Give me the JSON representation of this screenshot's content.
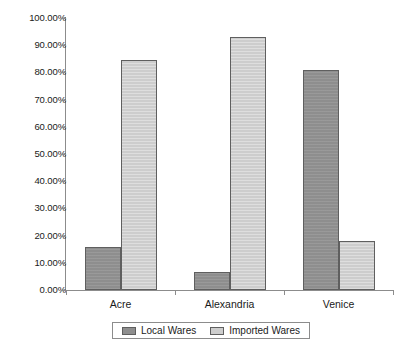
{
  "chart_data": {
    "type": "bar",
    "title": "",
    "subtitle": "",
    "xlabel": "",
    "ylabel": "",
    "categories": [
      "Acre",
      "Alexandria",
      "Venice"
    ],
    "series": [
      {
        "name": "Local Wares",
        "color": "#8e8e8e",
        "values": [
          15.8,
          6.6,
          81.0
        ]
      },
      {
        "name": "Imported Wares",
        "color": "#cdcdcd",
        "values": [
          84.5,
          93.0,
          18.0
        ]
      }
    ],
    "ylim": [
      0,
      100
    ],
    "ytick_step": 10,
    "ytick_labels": [
      "0.00%",
      "10.00%",
      "20.00%",
      "30.00%",
      "40.00%",
      "50.00%",
      "60.00%",
      "70.00%",
      "80.00%",
      "90.00%",
      "100.00%"
    ],
    "ytick_values": [
      0,
      10,
      20,
      30,
      40,
      50,
      60,
      70,
      80,
      90,
      100
    ],
    "grid": false,
    "legend_position": "bottom-center",
    "value_format": "percent"
  },
  "legend": {
    "entries": [
      {
        "label": "Local Wares"
      },
      {
        "label": "Imported Wares"
      }
    ]
  },
  "caption": {
    "text": ""
  }
}
